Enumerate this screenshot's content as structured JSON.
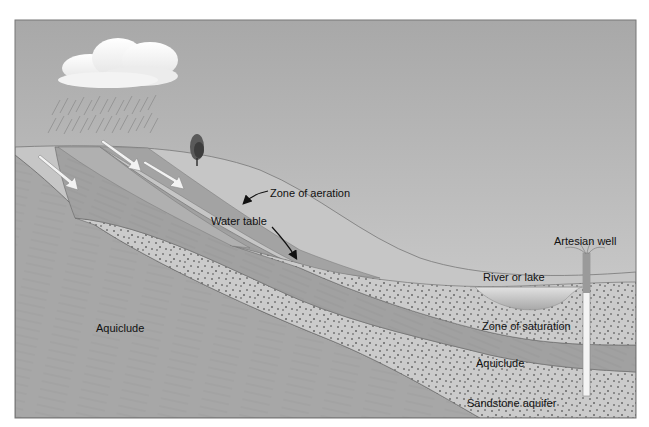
{
  "diagram": {
    "type": "groundwater cross-section",
    "labels": {
      "zone_of_aeration": "Zone of aeration",
      "water_table": "Water table",
      "artesian_well": "Artesian well",
      "river_or_lake": "River or lake",
      "zone_of_saturation": "Zone of saturation",
      "aquiclude_lower_left": "Aquiclude",
      "aquiclude_right": "Aquiclude",
      "sandstone_aquifer": "Sandstone aquifer"
    },
    "elements": {
      "cloud": "cloud",
      "rain": "rain",
      "tree": "tree",
      "infiltration_arrows": 4
    },
    "colors": {
      "sky_top": "#a9a9a9",
      "sky_bottom": "#d6d6d6",
      "aeration_zone": "#c4c4c4",
      "aquiclude": "#a6a6a6",
      "aquifer_band": "#9f9f9f",
      "sandstone": "#c8c8c8",
      "speckle": "#8a8a8a",
      "water": "#bdbdbd",
      "frame": "#555555"
    }
  }
}
